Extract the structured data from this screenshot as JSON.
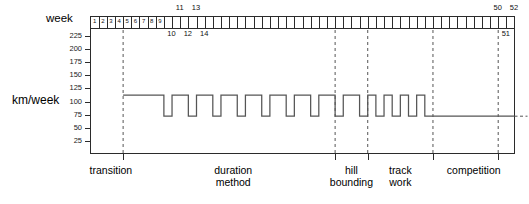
{
  "axes": {
    "x_title": "week",
    "y_title": "km/week",
    "y_ticks": [
      25,
      50,
      75,
      100,
      125,
      150,
      175,
      200,
      225
    ],
    "y_range": [
      0,
      240
    ],
    "x_range": [
      0,
      52
    ],
    "x_tick_step": 1,
    "week_labels_in_band": [
      "1",
      "2",
      "3",
      "4",
      "5",
      "6",
      "7",
      "8",
      "9"
    ],
    "week_labels_above": [
      "11",
      "13",
      "50",
      "52"
    ],
    "week_labels_below": [
      "10",
      "12",
      "14",
      "51"
    ]
  },
  "phases": [
    {
      "label": "transition",
      "start_week": 0,
      "end_week": 5,
      "center_week": 2.5
    },
    {
      "label": "duration method",
      "start_week": 5,
      "end_week": 30,
      "center_week": 17.5
    },
    {
      "label": "hill\nbounding",
      "start_week": 30,
      "end_week": 34,
      "center_week": 32
    },
    {
      "label": "track work",
      "start_week": 34,
      "end_week": 42,
      "center_week": 38
    },
    {
      "label": "competition",
      "start_week": 42,
      "end_week": 52,
      "center_week": 47
    }
  ],
  "colors": {
    "axis": "#2b2b2b",
    "series": "#555555",
    "divider": "#555555",
    "background": "#ffffff"
  },
  "chart_data": {
    "type": "line",
    "title": "",
    "xlabel": "week",
    "ylabel": "km/week",
    "xlim": [
      0,
      52
    ],
    "ylim": [
      0,
      240
    ],
    "grid": false,
    "legend": "none",
    "step_style": "post",
    "annotations": [
      "transition",
      "duration method",
      "hill bounding",
      "track work",
      "competition"
    ],
    "dividers_at_weeks": [
      4,
      30,
      34,
      42,
      50
    ],
    "series": [
      {
        "name": "training volume",
        "high_value": 112,
        "low_value": 72,
        "x": [
          4,
          7,
          9,
          10,
          12,
          13,
          15,
          16,
          18,
          19,
          21,
          22,
          24,
          25,
          27,
          28,
          30,
          31,
          33,
          34,
          35,
          36,
          37,
          38,
          39,
          40,
          41,
          52
        ],
        "values": [
          112,
          112,
          72,
          112,
          72,
          112,
          72,
          112,
          72,
          112,
          72,
          112,
          72,
          112,
          72,
          112,
          72,
          112,
          72,
          112,
          72,
          112,
          72,
          112,
          72,
          112,
          72,
          72
        ]
      }
    ]
  }
}
